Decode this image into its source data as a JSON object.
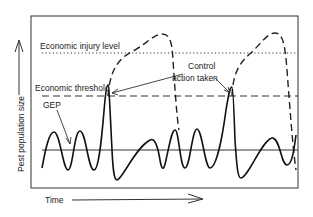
{
  "diagram": {
    "type": "pest-population-dynamics",
    "labels": {
      "economic_injury_level": "Economic injury level",
      "economic_threshold": "Economic threshold",
      "gep": "GEP",
      "control_line1": "Control",
      "control_line2": "action taken",
      "y_axis": "Pest population size",
      "x_axis": "Time"
    },
    "lines": {
      "economic_injury_level": {
        "style": "dotted",
        "y_px": 53
      },
      "economic_threshold": {
        "style": "dashed",
        "y_px": 96
      },
      "gep": {
        "style": "solid",
        "y_px": 150
      }
    },
    "colors": {
      "ink": "#222222",
      "background": "#ffffff"
    }
  }
}
